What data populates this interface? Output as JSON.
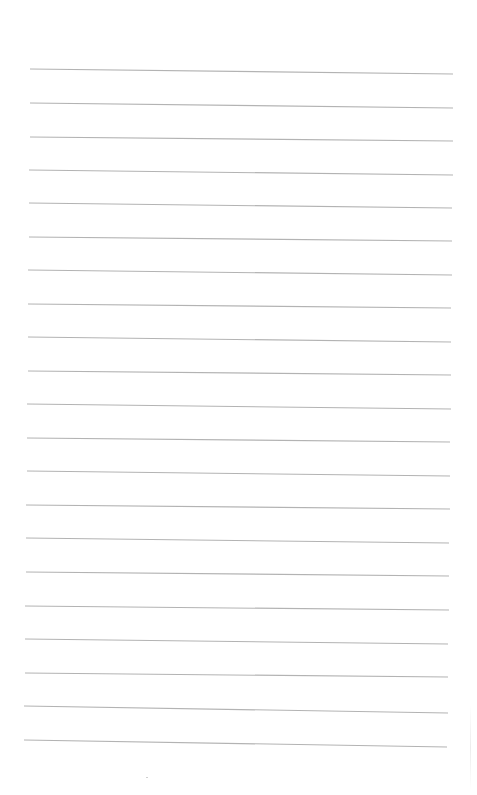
{
  "document": {
    "type": "lined-paper",
    "line_count": 21,
    "line_color": "#b3b3b3",
    "background": "#ffffff",
    "lines": [
      {
        "x1": 30,
        "y1": 69,
        "x2": 453,
        "y2": 74
      },
      {
        "x1": 30,
        "y1": 103,
        "x2": 453,
        "y2": 108
      },
      {
        "x1": 30,
        "y1": 137,
        "x2": 453,
        "y2": 141
      },
      {
        "x1": 29,
        "y1": 170,
        "x2": 453,
        "y2": 175
      },
      {
        "x1": 29,
        "y1": 203,
        "x2": 452,
        "y2": 208
      },
      {
        "x1": 29,
        "y1": 237,
        "x2": 452,
        "y2": 241
      },
      {
        "x1": 28,
        "y1": 270,
        "x2": 452,
        "y2": 275
      },
      {
        "x1": 28,
        "y1": 304,
        "x2": 451,
        "y2": 308
      },
      {
        "x1": 28,
        "y1": 337,
        "x2": 451,
        "y2": 342
      },
      {
        "x1": 28,
        "y1": 371,
        "x2": 451,
        "y2": 375
      },
      {
        "x1": 27,
        "y1": 404,
        "x2": 451,
        "y2": 409
      },
      {
        "x1": 27,
        "y1": 438,
        "x2": 450,
        "y2": 442
      },
      {
        "x1": 27,
        "y1": 471,
        "x2": 450,
        "y2": 476
      },
      {
        "x1": 26,
        "y1": 505,
        "x2": 450,
        "y2": 509
      },
      {
        "x1": 26,
        "y1": 538,
        "x2": 449,
        "y2": 543
      },
      {
        "x1": 26,
        "y1": 572,
        "x2": 449,
        "y2": 576
      },
      {
        "x1": 25,
        "y1": 606,
        "x2": 449,
        "y2": 610
      },
      {
        "x1": 25,
        "y1": 639,
        "x2": 448,
        "y2": 644
      },
      {
        "x1": 25,
        "y1": 673,
        "x2": 448,
        "y2": 677
      },
      {
        "x1": 24,
        "y1": 706,
        "x2": 448,
        "y2": 713
      },
      {
        "x1": 24,
        "y1": 740,
        "x2": 447,
        "y2": 747
      }
    ]
  }
}
